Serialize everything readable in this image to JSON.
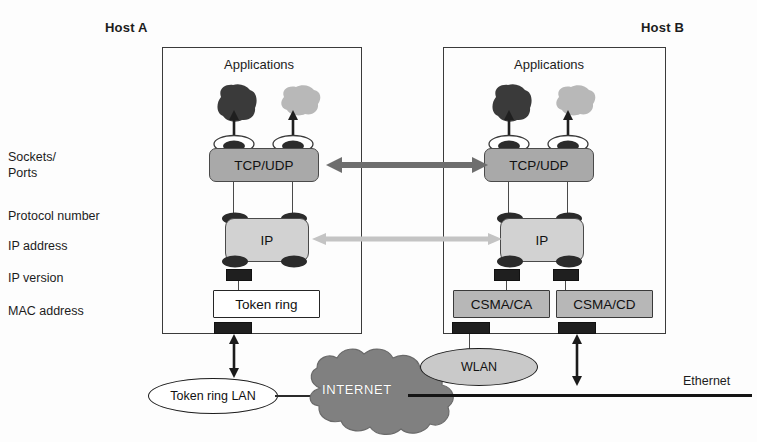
{
  "diagram": {
    "hosts": [
      {
        "id": "host-a",
        "title": "Host A",
        "apps_label": "Applications"
      },
      {
        "id": "host-b",
        "title": "Host B",
        "apps_label": "Applications"
      }
    ],
    "side_labels": [
      {
        "id": "sockets-ports",
        "line1": "Sockets/",
        "line2": "Ports"
      },
      {
        "id": "protocol-number",
        "line1": "Protocol number",
        "line2": ""
      },
      {
        "id": "ip-address",
        "line1": "IP address",
        "line2": ""
      },
      {
        "id": "ip-version",
        "line1": "IP version",
        "line2": ""
      },
      {
        "id": "mac-address",
        "line1": "MAC address",
        "line2": ""
      }
    ],
    "layers": {
      "transport": "TCP/UDP",
      "internet": "IP",
      "host_a_link": [
        "Token ring"
      ],
      "host_b_link": [
        "CSMA/CA",
        "CSMA/CD"
      ]
    },
    "networks": [
      {
        "id": "token-ring-lan",
        "label": "Token ring LAN",
        "shape": "ellipse",
        "fill": "#ffffff"
      },
      {
        "id": "internet-cloud",
        "label": "INTERNET",
        "shape": "cloud",
        "fill": "#808080"
      },
      {
        "id": "wlan",
        "label": "WLAN",
        "shape": "ellipse",
        "fill": "#c9c9c9"
      },
      {
        "id": "ethernet",
        "label": "Ethernet",
        "shape": "bus",
        "fill": "#141414"
      }
    ],
    "peer_connections": [
      {
        "id": "transport-peer",
        "level": "TCP/UDP",
        "style": "double-headed-arrow",
        "color": "#6e6e6e"
      },
      {
        "id": "internet-peer",
        "level": "IP",
        "style": "double-headed-arrow",
        "color": "#c4c4c4"
      }
    ],
    "colors": {
      "transport_box": "#a9a9a9",
      "internet_box": "#d2d2d2",
      "link_box_gray": "#b7b7b7",
      "link_box_white": "#ffffff",
      "app_blob_dark": "#3a3a3a",
      "app_blob_light": "#b8b8b8",
      "cloud": "#808080",
      "wlan": "#c9c9c9",
      "frame_stroke": "#3b3b3b"
    }
  }
}
